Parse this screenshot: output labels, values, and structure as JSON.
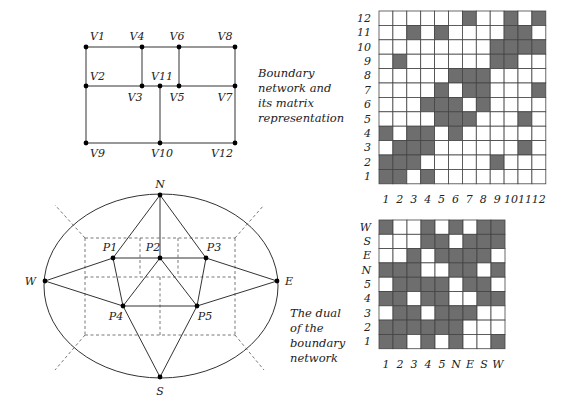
{
  "top_network": {
    "caption": [
      "Boundary",
      "network and",
      "its matrix",
      "representation"
    ],
    "vertices": [
      {
        "id": "V1",
        "x": 86,
        "y": 47,
        "lx": 90,
        "ly": 40,
        "anchor": "start"
      },
      {
        "id": "V4",
        "x": 142,
        "y": 47,
        "lx": 137,
        "ly": 40,
        "anchor": "middle"
      },
      {
        "id": "V6",
        "x": 179,
        "y": 47,
        "lx": 177,
        "ly": 40,
        "anchor": "middle"
      },
      {
        "id": "V8",
        "x": 235,
        "y": 47,
        "lx": 225,
        "ly": 40,
        "anchor": "middle"
      },
      {
        "id": "V2",
        "x": 86,
        "y": 86,
        "lx": 90,
        "ly": 80,
        "anchor": "start"
      },
      {
        "id": "V11",
        "x": 160,
        "y": 86,
        "lx": 162,
        "ly": 80,
        "anchor": "middle"
      },
      {
        "id": "V3",
        "x": 142,
        "y": 86,
        "lx": 135,
        "ly": 101,
        "anchor": "middle"
      },
      {
        "id": "V5",
        "x": 179,
        "y": 86,
        "lx": 177,
        "ly": 101,
        "anchor": "middle"
      },
      {
        "id": "V7",
        "x": 235,
        "y": 86,
        "lx": 225,
        "ly": 101,
        "anchor": "middle"
      },
      {
        "id": "V9",
        "x": 86,
        "y": 143,
        "lx": 90,
        "ly": 157,
        "anchor": "start"
      },
      {
        "id": "V10",
        "x": 160,
        "y": 143,
        "lx": 162,
        "ly": 157,
        "anchor": "middle"
      },
      {
        "id": "V12",
        "x": 235,
        "y": 143,
        "lx": 222,
        "ly": 157,
        "anchor": "middle"
      }
    ],
    "edges": [
      [
        "V1",
        "V4"
      ],
      [
        "V4",
        "V6"
      ],
      [
        "V6",
        "V8"
      ],
      [
        "V2",
        "V3"
      ],
      [
        "V3",
        "V11"
      ],
      [
        "V11",
        "V5"
      ],
      [
        "V5",
        "V7"
      ],
      [
        "V9",
        "V10"
      ],
      [
        "V10",
        "V12"
      ],
      [
        "V1",
        "V2"
      ],
      [
        "V2",
        "V9"
      ],
      [
        "V4",
        "V3"
      ],
      [
        "V6",
        "V5"
      ],
      [
        "V8",
        "V7"
      ],
      [
        "V7",
        "V12"
      ],
      [
        "V11",
        "V10"
      ]
    ]
  },
  "top_matrix": {
    "x": 379,
    "y": 11,
    "cell_w": 13.9,
    "cell_h": 14.4,
    "row_labels": [
      "12",
      "11",
      "10",
      "9",
      "8",
      "7",
      "6",
      "5",
      "4",
      "3",
      "2",
      "1"
    ],
    "col_labels": [
      "1",
      "2",
      "3",
      "4",
      "5",
      "6",
      "7",
      "8",
      "9",
      "10",
      "11",
      "12"
    ],
    "filled_color": "#6e6e6e",
    "rows": [
      [
        0,
        0,
        0,
        0,
        0,
        0,
        1,
        0,
        0,
        1,
        0,
        1
      ],
      [
        0,
        0,
        1,
        0,
        1,
        0,
        0,
        0,
        0,
        1,
        1,
        0
      ],
      [
        0,
        0,
        0,
        0,
        0,
        0,
        0,
        0,
        1,
        1,
        1,
        1
      ],
      [
        0,
        1,
        0,
        0,
        0,
        0,
        0,
        0,
        1,
        1,
        0,
        0
      ],
      [
        0,
        0,
        0,
        0,
        0,
        1,
        1,
        1,
        0,
        0,
        0,
        0
      ],
      [
        0,
        0,
        0,
        0,
        1,
        0,
        1,
        1,
        0,
        0,
        0,
        1
      ],
      [
        0,
        0,
        0,
        1,
        1,
        1,
        0,
        1,
        0,
        0,
        0,
        0
      ],
      [
        0,
        0,
        0,
        0,
        1,
        1,
        1,
        0,
        0,
        0,
        1,
        0
      ],
      [
        1,
        0,
        1,
        1,
        0,
        1,
        0,
        0,
        0,
        0,
        0,
        0
      ],
      [
        0,
        1,
        1,
        1,
        0,
        0,
        0,
        0,
        0,
        0,
        1,
        0
      ],
      [
        1,
        1,
        1,
        0,
        0,
        0,
        0,
        0,
        1,
        0,
        0,
        0
      ],
      [
        1,
        1,
        0,
        1,
        0,
        0,
        0,
        0,
        0,
        0,
        0,
        0
      ]
    ]
  },
  "dual_graph": {
    "caption": [
      "The dual",
      "of the",
      "boundary",
      "network"
    ],
    "ellipse": {
      "cx": 161,
      "cy": 286,
      "rx": 117,
      "ry": 92
    },
    "nodes": [
      {
        "id": "N",
        "x": 160,
        "y": 195,
        "lx": 160,
        "ly": 188,
        "anchor": "middle"
      },
      {
        "id": "W",
        "x": 45,
        "y": 281,
        "lx": 36,
        "ly": 285,
        "anchor": "end"
      },
      {
        "id": "E",
        "x": 277,
        "y": 281,
        "lx": 285,
        "ly": 285,
        "anchor": "start"
      },
      {
        "id": "S",
        "x": 160,
        "y": 377,
        "lx": 160,
        "ly": 395,
        "anchor": "middle"
      },
      {
        "id": "P1",
        "x": 113,
        "y": 258,
        "lx": 110,
        "ly": 251,
        "anchor": "middle"
      },
      {
        "id": "P2",
        "x": 160,
        "y": 258,
        "lx": 153,
        "ly": 251,
        "anchor": "middle"
      },
      {
        "id": "P3",
        "x": 206,
        "y": 258,
        "lx": 214,
        "ly": 251,
        "anchor": "middle"
      },
      {
        "id": "P4",
        "x": 123,
        "y": 306,
        "lx": 116,
        "ly": 320,
        "anchor": "middle"
      },
      {
        "id": "P5",
        "x": 197,
        "y": 306,
        "lx": 205,
        "ly": 320,
        "anchor": "middle"
      }
    ],
    "edges": [
      [
        "N",
        "P1"
      ],
      [
        "N",
        "P2"
      ],
      [
        "N",
        "P3"
      ],
      [
        "W",
        "P1"
      ],
      [
        "W",
        "P4"
      ],
      [
        "E",
        "P3"
      ],
      [
        "E",
        "P5"
      ],
      [
        "S",
        "P4"
      ],
      [
        "S",
        "P5"
      ],
      [
        "P1",
        "P2"
      ],
      [
        "P2",
        "P3"
      ],
      [
        "P1",
        "P4"
      ],
      [
        "P3",
        "P5"
      ],
      [
        "P2",
        "P4"
      ],
      [
        "P2",
        "P5"
      ],
      [
        "P4",
        "P5"
      ]
    ],
    "dashed_lines": [
      [
        85,
        238,
        235,
        238
      ],
      [
        85,
        335,
        235,
        335
      ],
      [
        85,
        238,
        85,
        335
      ],
      [
        235,
        238,
        235,
        335
      ],
      [
        85,
        277,
        235,
        277
      ],
      [
        140,
        238,
        140,
        277
      ],
      [
        178,
        238,
        178,
        277
      ],
      [
        160,
        277,
        160,
        335
      ],
      [
        85,
        238,
        55,
        205
      ],
      [
        235,
        238,
        264,
        205
      ],
      [
        85,
        335,
        55,
        370
      ],
      [
        235,
        335,
        264,
        370
      ]
    ]
  },
  "bottom_matrix": {
    "x": 379,
    "y": 220,
    "cell_w": 14,
    "cell_h": 14.3,
    "row_labels": [
      "W",
      "S",
      "E",
      "N",
      "5",
      "4",
      "3",
      "2",
      "1"
    ],
    "col_labels": [
      "1",
      "2",
      "3",
      "4",
      "5",
      "N",
      "E",
      "S",
      "W"
    ],
    "filled_color": "#6e6e6e",
    "rows": [
      [
        1,
        0,
        0,
        1,
        0,
        1,
        0,
        1,
        1
      ],
      [
        0,
        0,
        0,
        1,
        1,
        0,
        1,
        1,
        1
      ],
      [
        0,
        0,
        1,
        0,
        1,
        1,
        1,
        1,
        0
      ],
      [
        1,
        1,
        1,
        0,
        0,
        1,
        1,
        0,
        1
      ],
      [
        0,
        1,
        1,
        1,
        1,
        0,
        1,
        1,
        0
      ],
      [
        1,
        1,
        0,
        1,
        1,
        0,
        0,
        1,
        1
      ],
      [
        0,
        1,
        1,
        0,
        1,
        1,
        1,
        0,
        0
      ],
      [
        1,
        1,
        1,
        1,
        1,
        1,
        0,
        0,
        0
      ],
      [
        1,
        1,
        0,
        1,
        0,
        1,
        0,
        0,
        1
      ]
    ]
  }
}
